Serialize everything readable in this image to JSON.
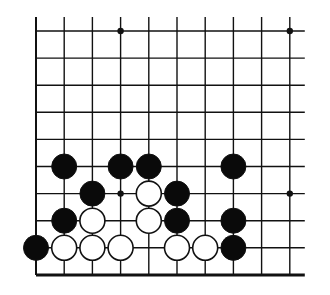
{
  "board": {
    "origin_x": 36,
    "origin_y": 31,
    "col_spacing": 28.2,
    "row_spacing": 27.1,
    "cols": 10,
    "rows": 10,
    "top_extend": 14,
    "right_extend": 15,
    "line_color": "#111111",
    "stone_radius": 12.5,
    "hoshi": [
      [
        3,
        0
      ],
      [
        9,
        0
      ],
      [
        3,
        6
      ],
      [
        9,
        6
      ]
    ],
    "stones": [
      {
        "color": "black",
        "col": 1,
        "row": 5
      },
      {
        "color": "black",
        "col": 3,
        "row": 5
      },
      {
        "color": "black",
        "col": 4,
        "row": 5
      },
      {
        "color": "black",
        "col": 7,
        "row": 5
      },
      {
        "color": "black",
        "col": 2,
        "row": 6
      },
      {
        "color": "white",
        "col": 4,
        "row": 6
      },
      {
        "color": "black",
        "col": 5,
        "row": 6
      },
      {
        "color": "black",
        "col": 1,
        "row": 7
      },
      {
        "color": "white",
        "col": 2,
        "row": 7
      },
      {
        "color": "white",
        "col": 4,
        "row": 7
      },
      {
        "color": "black",
        "col": 5,
        "row": 7
      },
      {
        "color": "black",
        "col": 7,
        "row": 7
      },
      {
        "color": "black",
        "col": 0,
        "row": 8
      },
      {
        "color": "white",
        "col": 1,
        "row": 8
      },
      {
        "color": "white",
        "col": 2,
        "row": 8
      },
      {
        "color": "white",
        "col": 3,
        "row": 8
      },
      {
        "color": "white",
        "col": 5,
        "row": 8
      },
      {
        "color": "white",
        "col": 6,
        "row": 8
      },
      {
        "color": "black",
        "col": 7,
        "row": 8
      }
    ]
  }
}
